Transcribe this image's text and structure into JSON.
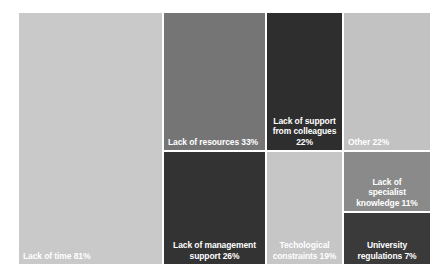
{
  "chart_data": {
    "type": "treemap",
    "title": "",
    "xlabel": "",
    "ylabel": "",
    "grid": false,
    "legend": "none",
    "value_unit": "percent",
    "note": "Percentages are multiple-response shares and sum to more than 100%.",
    "categories": [
      "Lack of time",
      "Lack of resources",
      "Lack of support from colleagues",
      "Other",
      "Lack of management support",
      "Techological constraints",
      "Lack of specialist knowledge",
      "University regulations"
    ],
    "values": [
      81,
      33,
      22,
      22,
      26,
      19,
      11,
      7
    ],
    "tiles": [
      {
        "id": "lack-of-time",
        "label": "Lack of time",
        "value": 81,
        "text": "Lack of time 81%",
        "color": "#c9c9c9",
        "text_color": "#ffffff",
        "align": "left"
      },
      {
        "id": "lack-of-resources",
        "label": "Lack of resources",
        "value": 33,
        "text": "Lack of resources 33%",
        "color": "#757575",
        "text_color": "#ffffff",
        "align": "left"
      },
      {
        "id": "lack-of-support-from-colleagues",
        "label": "Lack of support from colleagues",
        "value": 22,
        "text": "Lack of support\nfrom colleagues\n22%",
        "color": "#2e2e2e",
        "text_color": "#ffffff",
        "align": "center"
      },
      {
        "id": "other",
        "label": "Other",
        "value": 22,
        "text": "Other 22%",
        "color": "#c2c2c2",
        "text_color": "#ffffff",
        "align": "left"
      },
      {
        "id": "lack-of-management-support",
        "label": "Lack of management support",
        "value": 26,
        "text": "Lack of management\nsupport 26%",
        "color": "#333333",
        "text_color": "#ffffff",
        "align": "center"
      },
      {
        "id": "techological-constraints",
        "label": "Techological constraints",
        "value": 19,
        "text": "Techological\nconstraints 19%",
        "color": "#c6c6c6",
        "text_color": "#ffffff",
        "align": "center"
      },
      {
        "id": "lack-of-specialist-knowledge",
        "label": "Lack of specialist knowledge",
        "value": 11,
        "text": "Lack of\nspecialist\nknowledge 11%",
        "color": "#8a8a8a",
        "text_color": "#ffffff",
        "align": "center"
      },
      {
        "id": "university-regulations",
        "label": "University regulations",
        "value": 7,
        "text": "University\nregulations 7%",
        "color": "#3a3a3a",
        "text_color": "#ffffff",
        "align": "center"
      }
    ]
  }
}
